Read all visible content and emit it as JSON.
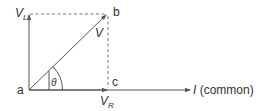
{
  "diagram": {
    "type": "phasor",
    "colors": {
      "line": "#555555",
      "text": "#333333",
      "background": "#ffffff"
    },
    "points": {
      "a": {
        "label": "a"
      },
      "b": {
        "label": "b"
      },
      "c": {
        "label": "c"
      }
    },
    "vectors": {
      "vl": {
        "label_main": "V",
        "label_sub": "L"
      },
      "v": {
        "label": "V"
      },
      "vr": {
        "label_main": "V",
        "label_sub": "R"
      },
      "i": {
        "label_main": "I",
        "label_rest": " (common)"
      }
    },
    "angle": {
      "label": "θ"
    }
  }
}
